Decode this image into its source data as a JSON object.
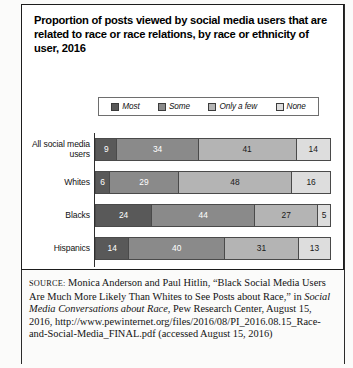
{
  "figure": {
    "title": "Proportion of posts viewed by social media users that are related to race or race relations, by race or ethnicity of user, 2016"
  },
  "legend": {
    "items": [
      {
        "label": "Most",
        "color": "#595959"
      },
      {
        "label": "Some",
        "color": "#8a8a8a"
      },
      {
        "label": "Only a few",
        "color": "#b4b4b4"
      },
      {
        "label": "None",
        "color": "#dddddd"
      }
    ]
  },
  "source": {
    "label": "SOURCE:",
    "line1": " Monica Anderson and Paul Hitlin, “Black Social Media Users Are Much More Likely Than Whites to See Posts about Race,” in ",
    "italic_title": "Social Media Conversations about Race",
    "line2": ", Pew Research Center, August 15, 2016, http://www.pewinternet.org/files/2016/08/PI_2016.08.15_Race-and-Social-Media_FINAL.pdf (accessed August 15, 2016)"
  },
  "chart_data": {
    "type": "bar",
    "subtype": "stacked-horizontal-100",
    "title": "Proportion of posts viewed by social media users that are related to race or race relations, by race or ethnicity of user, 2016",
    "xlabel": "",
    "ylabel": "",
    "xlim": [
      0,
      100
    ],
    "grid": false,
    "legend_position": "top",
    "categories": [
      "All social media users",
      "Whites",
      "Blacks",
      "Hispanics"
    ],
    "series": [
      {
        "name": "Most",
        "color": "#595959",
        "text_color": "#ffffff",
        "values": [
          9,
          6,
          24,
          14
        ]
      },
      {
        "name": "Some",
        "color": "#8a8a8a",
        "text_color": "#ffffff",
        "values": [
          34,
          29,
          44,
          40
        ]
      },
      {
        "name": "Only a few",
        "color": "#b4b4b4",
        "text_color": "#1a1a1a",
        "values": [
          41,
          48,
          27,
          31
        ]
      },
      {
        "name": "None",
        "color": "#dddddd",
        "text_color": "#1a1a1a",
        "values": [
          14,
          16,
          5,
          13
        ]
      }
    ]
  }
}
